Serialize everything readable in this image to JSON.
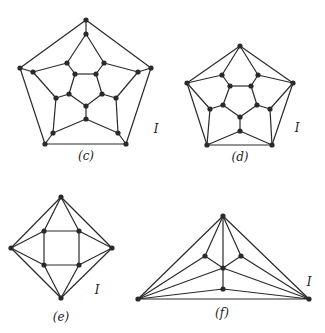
{
  "graphs": [
    {
      "id": "c",
      "caption": "(c)",
      "caption_pos": [
        86,
        160
      ],
      "label": "I",
      "label_pos": [
        156,
        133
      ],
      "nodes": [
        [
          86,
          20
        ],
        [
          86,
          34
        ],
        [
          67,
          63
        ],
        [
          104,
          63
        ],
        [
          20,
          68
        ],
        [
          33,
          72
        ],
        [
          151,
          68
        ],
        [
          138,
          72
        ],
        [
          75,
          74
        ],
        [
          96,
          74
        ],
        [
          69,
          94
        ],
        [
          102,
          94
        ],
        [
          56,
          98
        ],
        [
          116,
          98
        ],
        [
          86,
          106
        ],
        [
          86,
          119
        ],
        [
          53,
          133
        ],
        [
          118,
          133
        ],
        [
          45,
          144
        ],
        [
          126,
          144
        ]
      ],
      "edges": [
        [
          0,
          1
        ],
        [
          0,
          4
        ],
        [
          0,
          6
        ],
        [
          1,
          2
        ],
        [
          1,
          3
        ],
        [
          2,
          5
        ],
        [
          2,
          8
        ],
        [
          3,
          7
        ],
        [
          3,
          9
        ],
        [
          8,
          9
        ],
        [
          4,
          5
        ],
        [
          6,
          7
        ],
        [
          4,
          18
        ],
        [
          6,
          19
        ],
        [
          18,
          19
        ],
        [
          5,
          12
        ],
        [
          7,
          13
        ],
        [
          8,
          10
        ],
        [
          9,
          11
        ],
        [
          10,
          12
        ],
        [
          11,
          13
        ],
        [
          10,
          14
        ],
        [
          11,
          14
        ],
        [
          14,
          15
        ],
        [
          12,
          16
        ],
        [
          13,
          17
        ],
        [
          15,
          16
        ],
        [
          15,
          17
        ],
        [
          16,
          18
        ],
        [
          17,
          19
        ]
      ]
    },
    {
      "id": "d",
      "caption": "(d)",
      "caption_pos": [
        240,
        161
      ],
      "label": "I",
      "label_pos": [
        297,
        132
      ],
      "nodes": [
        [
          240,
          46
        ],
        [
          187,
          83
        ],
        [
          293,
          83
        ],
        [
          207,
          145
        ],
        [
          272,
          145
        ],
        [
          222,
          75
        ],
        [
          258,
          75
        ],
        [
          230,
          86
        ],
        [
          251,
          86
        ],
        [
          210,
          109
        ],
        [
          223,
          105
        ],
        [
          257,
          105
        ],
        [
          270,
          109
        ],
        [
          240,
          117
        ],
        [
          240,
          131
        ]
      ],
      "edges": [
        [
          0,
          1
        ],
        [
          0,
          2
        ],
        [
          0,
          5
        ],
        [
          0,
          6
        ],
        [
          1,
          5
        ],
        [
          2,
          6
        ],
        [
          1,
          9
        ],
        [
          2,
          12
        ],
        [
          1,
          3
        ],
        [
          2,
          4
        ],
        [
          3,
          4
        ],
        [
          5,
          7
        ],
        [
          6,
          8
        ],
        [
          7,
          8
        ],
        [
          7,
          10
        ],
        [
          8,
          11
        ],
        [
          10,
          9
        ],
        [
          11,
          12
        ],
        [
          10,
          13
        ],
        [
          11,
          13
        ],
        [
          13,
          14
        ],
        [
          9,
          3
        ],
        [
          12,
          4
        ],
        [
          14,
          3
        ],
        [
          14,
          4
        ]
      ]
    },
    {
      "id": "e",
      "caption": "(e)",
      "caption_pos": [
        61,
        321
      ],
      "label": "I",
      "label_pos": [
        97,
        294
      ],
      "nodes": [
        [
          61,
          197
        ],
        [
          11,
          248
        ],
        [
          112,
          248
        ],
        [
          61,
          298
        ],
        [
          44,
          231
        ],
        [
          79,
          231
        ],
        [
          44,
          265
        ],
        [
          79,
          265
        ]
      ],
      "edges": [
        [
          0,
          1
        ],
        [
          0,
          2
        ],
        [
          0,
          4
        ],
        [
          0,
          5
        ],
        [
          1,
          4
        ],
        [
          1,
          6
        ],
        [
          1,
          3
        ],
        [
          2,
          5
        ],
        [
          2,
          7
        ],
        [
          2,
          3
        ],
        [
          3,
          6
        ],
        [
          3,
          7
        ],
        [
          4,
          5
        ],
        [
          5,
          7
        ],
        [
          7,
          6
        ],
        [
          6,
          4
        ]
      ]
    },
    {
      "id": "f",
      "caption": "(f)",
      "caption_pos": [
        222,
        317
      ],
      "label": "I",
      "label_pos": [
        309,
        286
      ],
      "nodes": [
        [
          223,
          216
        ],
        [
          138,
          299
        ],
        [
          309,
          299
        ],
        [
          205,
          256
        ],
        [
          241,
          256
        ],
        [
          223,
          268
        ],
        [
          223,
          289
        ]
      ],
      "edges": [
        [
          0,
          1
        ],
        [
          0,
          2
        ],
        [
          0,
          3
        ],
        [
          0,
          4
        ],
        [
          0,
          5
        ],
        [
          5,
          6
        ],
        [
          3,
          5
        ],
        [
          4,
          5
        ],
        [
          1,
          3
        ],
        [
          1,
          5
        ],
        [
          1,
          6
        ],
        [
          1,
          2
        ],
        [
          2,
          4
        ],
        [
          2,
          5
        ],
        [
          2,
          6
        ]
      ]
    }
  ]
}
